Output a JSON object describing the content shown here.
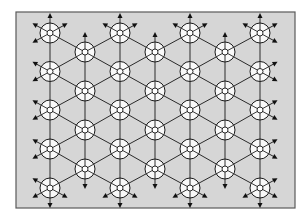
{
  "diagram": {
    "canvas": {
      "width": 307,
      "height": 223,
      "background": "#ffffff"
    },
    "frame": {
      "x": 16,
      "y": 12,
      "width": 279,
      "height": 196,
      "fill": "#d6d6d6",
      "stroke": "#5a5a5a"
    },
    "colors": {
      "edge": "#2a2a2a",
      "node_fill": "#ffffff",
      "node_stroke": "#1a1a1a",
      "arrow": "#111111"
    },
    "node_style": {
      "outer_radius": 10,
      "inner_radius": 3
    },
    "arrow_style": {
      "length": 10,
      "head": 5
    },
    "columns": [
      {
        "x": 50,
        "ys": [
          33,
          71.5,
          110,
          149,
          188
        ]
      },
      {
        "x": 85,
        "ys": [
          52,
          91,
          130,
          169
        ]
      },
      {
        "x": 120,
        "ys": [
          33,
          71.5,
          110,
          149,
          188
        ]
      },
      {
        "x": 155,
        "ys": [
          52,
          91,
          130,
          169
        ]
      },
      {
        "x": 190,
        "ys": [
          33,
          71.5,
          110,
          149,
          188
        ]
      },
      {
        "x": 225,
        "ys": [
          52,
          91,
          130,
          169
        ]
      },
      {
        "x": 260,
        "ys": [
          33,
          71.5,
          110,
          149,
          188
        ]
      }
    ],
    "directions": [
      "up",
      "down",
      "upper-left",
      "upper-right",
      "lower-left",
      "lower-right"
    ]
  }
}
